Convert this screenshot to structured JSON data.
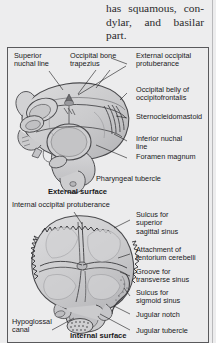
{
  "page": {
    "body_text": "has squamous, con-dylar, and basilar part."
  },
  "figure": {
    "panels": [
      {
        "id": "external",
        "caption": "External surface",
        "labels": [
          {
            "name": "superior-nuchal-line",
            "text": "Superior\nnuchal line"
          },
          {
            "name": "occipital-bone-trapezius",
            "text": "Occipital bone\ntrapezius"
          },
          {
            "name": "external-occipital-protuberance",
            "text": "External occipital\nprotuberance"
          },
          {
            "name": "occipital-belly-of-occipitofrontalis",
            "text": "Occipital belly of\noccipitofrontalis"
          },
          {
            "name": "sternocleidomastoid",
            "text": "Sternocleidomastoid"
          },
          {
            "name": "inferior-nuchal-line",
            "text": "Inferior nuchal\nline"
          },
          {
            "name": "foramen-magnum",
            "text": "Foramen magnum"
          },
          {
            "name": "pharyngeal-tubercle",
            "text": "Pharyngeal tubercle"
          }
        ]
      },
      {
        "id": "internal",
        "caption": "Internal surface",
        "labels": [
          {
            "name": "internal-occipital-protuberance",
            "text": "Internal occipital protuberance"
          },
          {
            "name": "sulcus-for-superior-sagittal-sinus",
            "text": "Sulcus for\nsuperior\nsagittal sinus"
          },
          {
            "name": "attachment-of-tentorium-cerebelli",
            "text": "Attachment of\ntentorium cerebelli"
          },
          {
            "name": "groove-for-transverse-sinus",
            "text": "Groove for\ntransverse sinus"
          },
          {
            "name": "sulcus-for-sigmoid-sinus",
            "text": "Sulcus for\nsigmoid sinus"
          },
          {
            "name": "jugular-notch",
            "text": "Jugular notch"
          },
          {
            "name": "jugular-tubercle",
            "text": "Jugular tubercle"
          },
          {
            "name": "hypoglossal-canal",
            "text": "Hypoglossal\ncanal"
          }
        ]
      }
    ]
  },
  "colors": {
    "page_background": "#ededee",
    "frame_border": "#59595c",
    "bone_light": "#d9d9da",
    "bone_mid": "#c6c6c8",
    "bone_dark": "#ababae",
    "outline": "#4a4a4d",
    "text": "#19191b"
  }
}
